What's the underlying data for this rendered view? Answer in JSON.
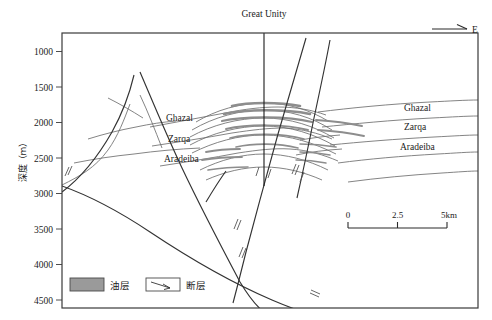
{
  "figure": {
    "type": "geological-cross-section",
    "well_label": "Great Unity",
    "direction_label": "E",
    "y_axis": {
      "title": "深度（m）",
      "unit": "m",
      "ticks": [
        1000,
        1500,
        2000,
        2500,
        3000,
        3500,
        4000,
        4500
      ],
      "min": 1000,
      "max": 4500
    },
    "formations_left": [
      {
        "name": "Ghazal"
      },
      {
        "name": "Zarqa"
      },
      {
        "name": "Aradeiba"
      }
    ],
    "formations_right": [
      {
        "name": "Ghazal"
      },
      {
        "name": "Zarqa"
      },
      {
        "name": "Aradeiba"
      }
    ],
    "scale_bar": {
      "ticks": [
        "0",
        "2.5",
        "5km"
      ]
    },
    "legend": [
      {
        "symbol": "oil-swatch",
        "label": "油层"
      },
      {
        "symbol": "fault-swatch",
        "label": "断层"
      }
    ],
    "colors": {
      "frame": "#3a3a3a",
      "horizon": "#6e6e6e",
      "fault": "#333333",
      "oil": "#8f8f8f",
      "oil_swatch": "#9a9a9a",
      "background": "#ffffff"
    }
  }
}
